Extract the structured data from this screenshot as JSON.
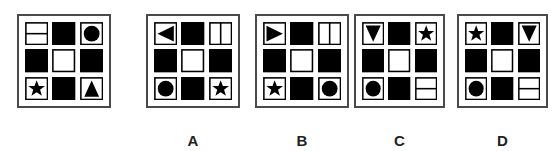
{
  "figure": {
    "type": "visual-analogy-matrix-puzzle",
    "stem_panel": {
      "name": "question-matrix",
      "label": "",
      "grid_rows": 3,
      "grid_cols": 3,
      "cells": [
        {
          "row": 1,
          "col": 1,
          "shape": "split-horizontal",
          "fill": "outline"
        },
        {
          "row": 1,
          "col": 2,
          "shape": "square",
          "fill": "solid"
        },
        {
          "row": 1,
          "col": 3,
          "shape": "circle",
          "fill": "solid"
        },
        {
          "row": 2,
          "col": 1,
          "shape": "square",
          "fill": "solid"
        },
        {
          "row": 2,
          "col": 2,
          "shape": "square",
          "fill": "outline"
        },
        {
          "row": 2,
          "col": 3,
          "shape": "square",
          "fill": "solid"
        },
        {
          "row": 3,
          "col": 1,
          "shape": "star",
          "fill": "solid"
        },
        {
          "row": 3,
          "col": 2,
          "shape": "square",
          "fill": "solid"
        },
        {
          "row": 3,
          "col": 3,
          "shape": "triangle-up",
          "fill": "solid"
        }
      ]
    },
    "options": [
      {
        "name": "option-a",
        "label": "A",
        "cells": [
          {
            "row": 1,
            "col": 1,
            "shape": "triangle-left",
            "fill": "solid"
          },
          {
            "row": 1,
            "col": 2,
            "shape": "square",
            "fill": "solid"
          },
          {
            "row": 1,
            "col": 3,
            "shape": "split-vertical",
            "fill": "outline"
          },
          {
            "row": 2,
            "col": 1,
            "shape": "square",
            "fill": "solid"
          },
          {
            "row": 2,
            "col": 2,
            "shape": "square",
            "fill": "outline"
          },
          {
            "row": 2,
            "col": 3,
            "shape": "square",
            "fill": "solid"
          },
          {
            "row": 3,
            "col": 1,
            "shape": "circle",
            "fill": "solid"
          },
          {
            "row": 3,
            "col": 2,
            "shape": "square",
            "fill": "solid"
          },
          {
            "row": 3,
            "col": 3,
            "shape": "star",
            "fill": "solid"
          }
        ]
      },
      {
        "name": "option-b",
        "label": "B",
        "cells": [
          {
            "row": 1,
            "col": 1,
            "shape": "triangle-right",
            "fill": "solid"
          },
          {
            "row": 1,
            "col": 2,
            "shape": "square",
            "fill": "solid"
          },
          {
            "row": 1,
            "col": 3,
            "shape": "split-vertical",
            "fill": "outline"
          },
          {
            "row": 2,
            "col": 1,
            "shape": "square",
            "fill": "solid"
          },
          {
            "row": 2,
            "col": 2,
            "shape": "square",
            "fill": "outline"
          },
          {
            "row": 2,
            "col": 3,
            "shape": "square",
            "fill": "solid"
          },
          {
            "row": 3,
            "col": 1,
            "shape": "star",
            "fill": "solid"
          },
          {
            "row": 3,
            "col": 2,
            "shape": "square",
            "fill": "solid"
          },
          {
            "row": 3,
            "col": 3,
            "shape": "circle",
            "fill": "solid"
          }
        ]
      },
      {
        "name": "option-c",
        "label": "C",
        "cells": [
          {
            "row": 1,
            "col": 1,
            "shape": "triangle-down",
            "fill": "solid"
          },
          {
            "row": 1,
            "col": 2,
            "shape": "square",
            "fill": "solid"
          },
          {
            "row": 1,
            "col": 3,
            "shape": "star",
            "fill": "solid"
          },
          {
            "row": 2,
            "col": 1,
            "shape": "square",
            "fill": "solid"
          },
          {
            "row": 2,
            "col": 2,
            "shape": "square",
            "fill": "outline"
          },
          {
            "row": 2,
            "col": 3,
            "shape": "square",
            "fill": "solid"
          },
          {
            "row": 3,
            "col": 1,
            "shape": "circle",
            "fill": "solid"
          },
          {
            "row": 3,
            "col": 2,
            "shape": "square",
            "fill": "solid"
          },
          {
            "row": 3,
            "col": 3,
            "shape": "split-horizontal",
            "fill": "outline"
          }
        ]
      },
      {
        "name": "option-d",
        "label": "D",
        "cells": [
          {
            "row": 1,
            "col": 1,
            "shape": "star",
            "fill": "solid"
          },
          {
            "row": 1,
            "col": 2,
            "shape": "square",
            "fill": "solid"
          },
          {
            "row": 1,
            "col": 3,
            "shape": "triangle-down",
            "fill": "solid"
          },
          {
            "row": 2,
            "col": 1,
            "shape": "square",
            "fill": "solid"
          },
          {
            "row": 2,
            "col": 2,
            "shape": "square",
            "fill": "outline"
          },
          {
            "row": 2,
            "col": 3,
            "shape": "square",
            "fill": "solid"
          },
          {
            "row": 3,
            "col": 1,
            "shape": "circle",
            "fill": "solid"
          },
          {
            "row": 3,
            "col": 2,
            "shape": "square",
            "fill": "solid"
          },
          {
            "row": 3,
            "col": 3,
            "shape": "split-horizontal",
            "fill": "outline"
          }
        ]
      }
    ],
    "colors": {
      "shape_fill": "#000000",
      "shape_stroke": "#000000",
      "panel_border": "#4a4a4a",
      "background": "#ffffff",
      "label_text": "#231f20"
    }
  }
}
